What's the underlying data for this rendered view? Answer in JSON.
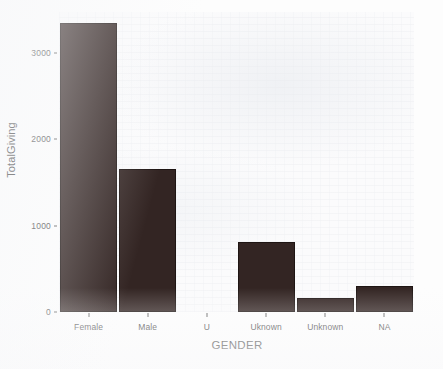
{
  "chart_data": {
    "type": "bar",
    "title": "",
    "subtitle": "",
    "xlabel": "GENDER",
    "ylabel": "TotalGiving",
    "categories": [
      "Female",
      "Male",
      "U",
      "Uknown",
      "Unknown",
      "NA"
    ],
    "values": [
      3280,
      1620,
      0,
      790,
      160,
      290
    ],
    "series": [
      {
        "name": "TotalGiving",
        "values": [
          3280,
          1620,
          0,
          790,
          160,
          290
        ]
      }
    ],
    "ylim": [
      0,
      3400
    ],
    "xlim": [
      0,
      6
    ],
    "y_ticks": [
      0,
      1000,
      2000,
      3000
    ],
    "y_tick_labels": [
      "0",
      "1000",
      "2000",
      "3000"
    ],
    "x_tick_labels": [
      "Female",
      "Male",
      "U",
      "Uknown",
      "Unknown",
      "NA"
    ],
    "grid": false,
    "legend": false,
    "legend_position": "none",
    "annotations": [],
    "bar_color": "#332523",
    "panel_background": "#fbfbfc",
    "axis_text_color": "#4d4d4d",
    "axis_title_color": "#222222"
  },
  "axes": {
    "y_title": "TotalGiving",
    "x_title": "GENDER",
    "y_tick_labels": [
      "3000",
      "2000",
      "1000",
      "0"
    ],
    "x_tick_labels": [
      "Female",
      "Male",
      "U",
      "Uknown",
      "Unknown",
      "NA"
    ]
  }
}
